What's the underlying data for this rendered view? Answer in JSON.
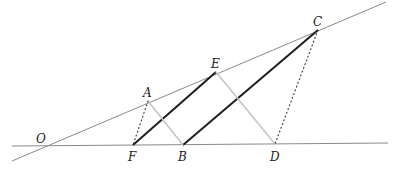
{
  "diagram": {
    "type": "geometry-construction",
    "colors": {
      "background": "#ffffff",
      "base_line": "#8a8a8a",
      "thick_segment": "#1e1e1e",
      "light_segment": "#c4c4c4",
      "dotted_segment": "#444444",
      "label": "#222222"
    },
    "lines": [
      {
        "name": "horizontal-ray",
        "from": [
          12,
          146
        ],
        "to": [
          388,
          143
        ]
      },
      {
        "name": "slanted-ray",
        "from": [
          12,
          161
        ],
        "to": [
          386,
          2
        ]
      }
    ],
    "points": {
      "O": {
        "label": "O",
        "x": 44,
        "y": 146,
        "lx": 36,
        "ly": 143
      },
      "A": {
        "label": "A",
        "x": 148,
        "y": 101,
        "lx": 143,
        "ly": 97
      },
      "E": {
        "label": "E",
        "x": 216,
        "y": 72,
        "lx": 211,
        "ly": 68
      },
      "C": {
        "label": "C",
        "x": 318,
        "y": 30,
        "lx": 313,
        "ly": 26
      },
      "F": {
        "label": "F",
        "x": 133,
        "y": 145,
        "lx": 128,
        "ly": 161
      },
      "B": {
        "label": "B",
        "x": 183,
        "y": 145,
        "lx": 178,
        "ly": 161
      },
      "D": {
        "label": "D",
        "x": 275,
        "y": 144,
        "lx": 270,
        "ly": 161
      }
    },
    "segments": [
      {
        "name": "segment-FE",
        "from": "F",
        "to": "E",
        "style": "thick"
      },
      {
        "name": "segment-BC",
        "from": "B",
        "to": "C",
        "style": "thick"
      },
      {
        "name": "segment-AB",
        "from": "A",
        "to": "B",
        "style": "light"
      },
      {
        "name": "segment-ED",
        "from": "E",
        "to": "D",
        "style": "light"
      },
      {
        "name": "segment-AF",
        "from": "A",
        "to": "F",
        "style": "dotted"
      },
      {
        "name": "segment-CD",
        "from": "C",
        "to": "D",
        "style": "dotted"
      }
    ]
  }
}
